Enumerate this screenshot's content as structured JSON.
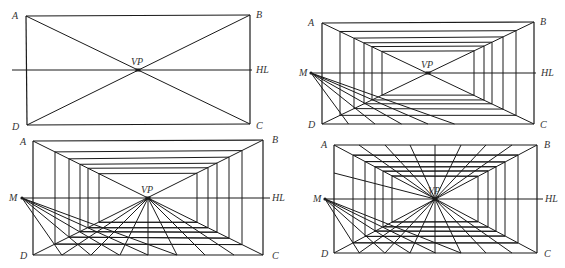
{
  "panels": [
    {
      "id": "panel-1",
      "corners": {
        "A": [
          26,
          16
        ],
        "B": [
          250,
          15
        ],
        "C": [
          250,
          124
        ],
        "D": [
          27,
          125
        ]
      },
      "vp": [
        138,
        70
      ],
      "hl": {
        "y": 70,
        "x1": 12,
        "x2": 252
      },
      "labels": [
        {
          "text": "A",
          "x": 12,
          "y": 19
        },
        {
          "text": "B",
          "x": 256,
          "y": 18
        },
        {
          "text": "C",
          "x": 256,
          "y": 129
        },
        {
          "text": "D",
          "x": 12,
          "y": 130
        },
        {
          "text": "VP",
          "x": 131,
          "y": 65
        },
        {
          "text": "HL",
          "x": 256,
          "y": 73
        }
      ],
      "diagonals": true,
      "inner_frames": [],
      "measure_point": null,
      "floor_divisions": [],
      "ceiling_divisions": []
    },
    {
      "id": "panel-2",
      "corners": {
        "A": [
          322,
          23
        ],
        "B": [
          534,
          22
        ],
        "C": [
          534,
          124
        ],
        "D": [
          322,
          124
        ]
      },
      "vp": [
        428,
        73
      ],
      "hl": {
        "y": 73,
        "x1": 311,
        "x2": 536
      },
      "labels": [
        {
          "text": "A",
          "x": 308,
          "y": 26
        },
        {
          "text": "B",
          "x": 540,
          "y": 25
        },
        {
          "text": "C",
          "x": 540,
          "y": 128
        },
        {
          "text": "D",
          "x": 308,
          "y": 128
        },
        {
          "text": "VP",
          "x": 421,
          "y": 68
        },
        {
          "text": "HL",
          "x": 541,
          "y": 76
        },
        {
          "text": "M",
          "x": 299,
          "y": 76
        }
      ],
      "diagonals": true,
      "inner_frames": [
        {
          "left": 340,
          "right": 516
        },
        {
          "left": 354,
          "right": 503
        },
        {
          "left": 364,
          "right": 492
        },
        {
          "left": 372,
          "right": 484
        },
        {
          "left": 382,
          "right": 474
        }
      ],
      "measure_point": [
        311,
        73
      ],
      "floor_marks": [
        347,
        375,
        402,
        428,
        454,
        481,
        507
      ],
      "floor_divisions": [],
      "ceiling_divisions": []
    },
    {
      "id": "panel-3",
      "corners": {
        "A": [
          33,
          141
        ],
        "B": [
          263,
          140
        ],
        "C": [
          263,
          255
        ],
        "D": [
          33,
          255
        ]
      },
      "vp": [
        148,
        198
      ],
      "hl": {
        "y": 198,
        "x1": 22,
        "x2": 270
      },
      "labels": [
        {
          "text": "A",
          "x": 20,
          "y": 145
        },
        {
          "text": "B",
          "x": 272,
          "y": 143
        },
        {
          "text": "C",
          "x": 272,
          "y": 259
        },
        {
          "text": "D",
          "x": 20,
          "y": 259
        },
        {
          "text": "VP",
          "x": 141,
          "y": 193
        },
        {
          "text": "HL",
          "x": 272,
          "y": 201
        },
        {
          "text": "M",
          "x": 9,
          "y": 201
        }
      ],
      "diagonals": true,
      "inner_frames": [
        {
          "left": 55,
          "right": 242
        },
        {
          "left": 69,
          "right": 229
        },
        {
          "left": 80,
          "right": 217
        },
        {
          "left": 88,
          "right": 208
        },
        {
          "left": 99,
          "right": 197
        }
      ],
      "measure_point": [
        22,
        198
      ],
      "floor_divisions": [
        62,
        91,
        120,
        148,
        177,
        205,
        234
      ],
      "ceiling_divisions": []
    },
    {
      "id": "panel-4",
      "corners": {
        "A": [
          334,
          145
        ],
        "B": [
          537,
          145
        ],
        "C": [
          537,
          253
        ],
        "D": [
          334,
          253
        ]
      },
      "vp": [
        435,
        199
      ],
      "hl": {
        "y": 199,
        "x1": 325,
        "x2": 543
      },
      "labels": [
        {
          "text": "A",
          "x": 321,
          "y": 148
        },
        {
          "text": "B",
          "x": 544,
          "y": 148
        },
        {
          "text": "C",
          "x": 544,
          "y": 257
        },
        {
          "text": "D",
          "x": 321,
          "y": 257
        },
        {
          "text": "VP",
          "x": 428,
          "y": 194
        },
        {
          "text": "HL",
          "x": 545,
          "y": 202
        },
        {
          "text": "M",
          "x": 313,
          "y": 202
        }
      ],
      "diagonals": true,
      "inner_frames": [
        {
          "left": 353,
          "right": 518
        },
        {
          "left": 365,
          "right": 505
        },
        {
          "left": 375,
          "right": 496
        },
        {
          "left": 383,
          "right": 488
        },
        {
          "left": 392,
          "right": 478
        }
      ],
      "measure_point": [
        325,
        199
      ],
      "floor_divisions": [
        359,
        385,
        410,
        435,
        461,
        486,
        512
      ],
      "ceiling_divisions": [
        359,
        385,
        410,
        435,
        461,
        486,
        512
      ],
      "wall_line": {
        "from": [
          334,
          173
        ],
        "to": [
          435,
          199
        ]
      }
    }
  ],
  "colors": {
    "line": "#1a1a1a",
    "label": "#333333",
    "background": "#ffffff"
  }
}
